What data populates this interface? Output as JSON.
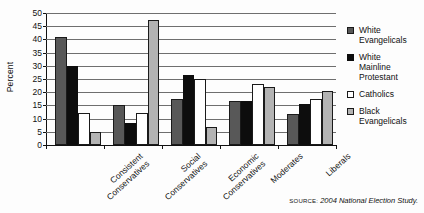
{
  "chart_data": {
    "type": "bar",
    "title": "",
    "subtitle": "",
    "xlabel": "",
    "ylabel": "Percent",
    "ylim": [
      0,
      50
    ],
    "ytick_values": [
      0,
      5,
      10,
      15,
      20,
      25,
      30,
      35,
      40,
      45,
      50
    ],
    "ytick_labels": [
      "0",
      "5",
      "10",
      "15",
      "20",
      "25",
      "30",
      "35",
      "40",
      "45",
      "50"
    ],
    "grid": true,
    "legend_position": "right",
    "categories": [
      "Consistent Conservatives",
      "Social Conservatives",
      "Economic Conservatives",
      "Moderates",
      "Liberals"
    ],
    "category_lines": [
      [
        "Consistent",
        "Conservatives"
      ],
      [
        "Social",
        "Conservatives"
      ],
      [
        "Economic",
        "Conservatives"
      ],
      [
        "Moderates"
      ],
      [
        "Liberals"
      ]
    ],
    "series": [
      {
        "name": "White Evangelicals",
        "name_lines": [
          "White",
          "Evangelicals"
        ],
        "color": "#585858",
        "values": [
          41,
          15,
          17.5,
          16.5,
          11.8
        ]
      },
      {
        "name": "White Mainline Protestant",
        "name_lines": [
          "White",
          "Mainline",
          "Protestant"
        ],
        "color": "#0d0d0d",
        "values": [
          30,
          8.5,
          26.5,
          16.5,
          15.5
        ]
      },
      {
        "name": "Catholics",
        "name_lines": [
          "Catholics"
        ],
        "color": "#ffffff",
        "values": [
          12,
          12,
          25,
          23,
          17.5
        ]
      },
      {
        "name": "Black Evangelicals",
        "name_lines": [
          "Black",
          "Evangelicals"
        ],
        "color": "#b3b3b3",
        "values": [
          5,
          47.5,
          7,
          22,
          20.5
        ]
      }
    ]
  },
  "source": {
    "prefix": "SOURCE:",
    "text": "2004 National Election Study."
  }
}
